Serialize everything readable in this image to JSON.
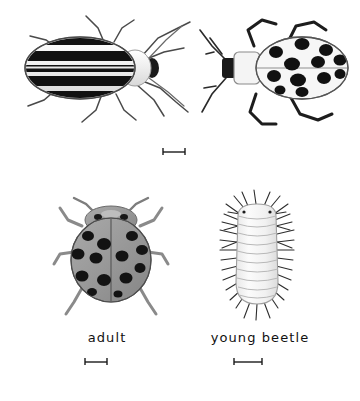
{
  "plate": {
    "title": "Cucumber beetle and lady beetle illustration plate",
    "background_color": "#ffffff",
    "ink_color": "#111111",
    "body_gray": "#9a9a9a",
    "pale_body": "#f2f2f2"
  },
  "figures": [
    {
      "id": "striped-beetle",
      "name": "striped-cucumber-beetle",
      "position": "top-left",
      "label": "",
      "description": "Dorsal view of striped beetle with five dark longitudinal stripes on pale elytra, pale pronotum, black head, six legs and two antennae",
      "stripe_count": 5,
      "leg_count": 6,
      "antenna_count": 2
    },
    {
      "id": "spotted-beetle",
      "name": "spotted-cucumber-beetle",
      "position": "top-right",
      "label": "",
      "description": "Dorsal view of spotted beetle with twelve black spots on pale elytra, pale square pronotum, dark head, six dark legs and two antennae",
      "spot_count": 12,
      "leg_count": 6,
      "antenna_count": 2
    },
    {
      "id": "adult-lady-beetle",
      "name": "adult-lady-beetle",
      "position": "bottom-left",
      "label": "adult",
      "description": "Dorsal view of gray lady beetle with black spots on elytra, spotted pronotum, six legs and two clubbed antennae",
      "spot_count": 13,
      "leg_count": 6,
      "antenna_count": 2
    },
    {
      "id": "young-beetle-larva",
      "name": "young-beetle-larva",
      "position": "bottom-right",
      "label": "young beetle",
      "description": "Dorsal view of pale segmented larva with rows of dark bristles along both sides and at the head and tail",
      "segment_count": 11
    }
  ],
  "labels": {
    "adult": "adult",
    "young_beetle": "young beetle"
  },
  "scale_bars": [
    {
      "id": "scale-bar-top",
      "name": "scale-bar-top",
      "length_px": 21,
      "caption": ""
    },
    {
      "id": "scale-bar-adult",
      "name": "scale-bar-adult",
      "length_px": 21,
      "caption": ""
    },
    {
      "id": "scale-bar-young-beetle",
      "name": "scale-bar-young-beetle",
      "length_px": 27,
      "caption": ""
    }
  ]
}
